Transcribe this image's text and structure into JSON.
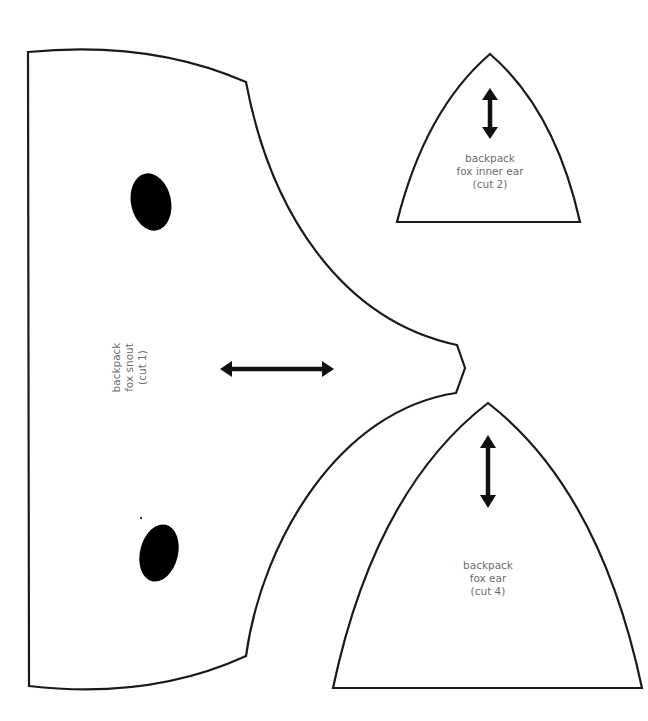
{
  "colors": {
    "outline": "#1a1a1a",
    "label_text": "#6d6d6d",
    "eye_fill": "#000000",
    "background": "#ffffff"
  },
  "pieces": {
    "snout": {
      "label_lines": [
        "backpack",
        "fox snout",
        "(cut 1)"
      ],
      "cut_count": 1,
      "features": [
        "left-eye-marking",
        "right-eye-marking",
        "horizontal-grainline-arrow"
      ]
    },
    "inner_ear": {
      "label_lines": [
        "backpack",
        "fox inner ear",
        "(cut 2)"
      ],
      "cut_count": 2,
      "features": [
        "vertical-grainline-arrow"
      ]
    },
    "ear": {
      "label_lines": [
        "backpack",
        "fox ear",
        "(cut 4)"
      ],
      "cut_count": 4,
      "features": [
        "vertical-grainline-arrow"
      ]
    }
  }
}
